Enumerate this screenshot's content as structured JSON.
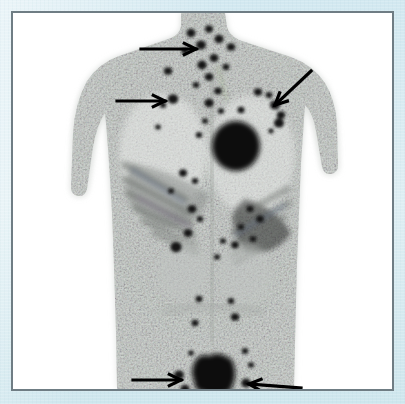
{
  "figure": {
    "caption": "",
    "modality_label": "whole-body maximum intensity projection scan",
    "frame_border_color": "#6f7d84",
    "page_background_color": "#dcebf0",
    "scan_background_color": "#ffffff",
    "lesion_color": "#111111",
    "soft_tissue_color": "#c9cdc9",
    "annotation_arrow_color": "#000000",
    "annotation_arrow_count": 5
  },
  "scan": {
    "view": "anterior whole-body MIP",
    "body": {
      "head_neck_top_y": 0,
      "shoulder_span_px": 262,
      "torso_bottom_y": 380
    },
    "arrows": [
      {
        "id": "arrow-1",
        "label": "supraclavicular nodal focus",
        "direction": "right",
        "tail_x": 128,
        "tail_y": 36,
        "head_x": 183,
        "head_y": 36
      },
      {
        "id": "arrow-2",
        "label": "left axillary nodal focus",
        "direction": "right",
        "tail_x": 104,
        "tail_y": 88,
        "head_x": 152,
        "head_y": 88
      },
      {
        "id": "arrow-3",
        "label": "right axillary nodal focus",
        "direction": "down-left",
        "tail_x": 298,
        "tail_y": 58,
        "head_x": 262,
        "head_y": 92
      },
      {
        "id": "arrow-4",
        "label": "left inguinal nodal focus",
        "direction": "right",
        "tail_x": 120,
        "tail_y": 367,
        "head_x": 168,
        "head_y": 367
      },
      {
        "id": "arrow-5",
        "label": "right inguinal nodal focus",
        "direction": "left",
        "tail_x": 288,
        "tail_y": 375,
        "head_x": 236,
        "head_y": 371
      }
    ],
    "major_foci": [
      {
        "id": "focus-mediastinal-mass",
        "label": "large mediastinal mass",
        "cx": 223,
        "cy": 133,
        "rx": 24,
        "ry": 25
      },
      {
        "id": "focus-bladder",
        "label": "urinary bladder uptake",
        "cx": 201,
        "cy": 362,
        "rx": 22,
        "ry": 19
      }
    ],
    "lesions": [
      {
        "cx": 178,
        "cy": 20,
        "r": 4.5
      },
      {
        "cx": 196,
        "cy": 16,
        "r": 4.0
      },
      {
        "cx": 188,
        "cy": 32,
        "r": 5.0
      },
      {
        "cx": 206,
        "cy": 26,
        "r": 4.6
      },
      {
        "cx": 218,
        "cy": 34,
        "r": 4.2
      },
      {
        "cx": 172,
        "cy": 38,
        "r": 3.6
      },
      {
        "cx": 201,
        "cy": 45,
        "r": 4.4
      },
      {
        "cx": 189,
        "cy": 52,
        "r": 4.8
      },
      {
        "cx": 155,
        "cy": 58,
        "r": 4.2
      },
      {
        "cx": 213,
        "cy": 54,
        "r": 3.4
      },
      {
        "cx": 196,
        "cy": 64,
        "r": 4.3
      },
      {
        "cx": 183,
        "cy": 72,
        "r": 3.3
      },
      {
        "cx": 205,
        "cy": 78,
        "r": 3.9
      },
      {
        "cx": 160,
        "cy": 86,
        "r": 5.2
      },
      {
        "cx": 150,
        "cy": 92,
        "r": 3.2
      },
      {
        "cx": 196,
        "cy": 90,
        "r": 4.7
      },
      {
        "cx": 208,
        "cy": 98,
        "r": 3.1
      },
      {
        "cx": 245,
        "cy": 79,
        "r": 4.1
      },
      {
        "cx": 256,
        "cy": 82,
        "r": 3.3
      },
      {
        "cx": 262,
        "cy": 92,
        "r": 5.0
      },
      {
        "cx": 268,
        "cy": 102,
        "r": 4.2
      },
      {
        "cx": 266,
        "cy": 110,
        "r": 5.1
      },
      {
        "cx": 228,
        "cy": 97,
        "r": 3.5
      },
      {
        "cx": 192,
        "cy": 108,
        "r": 3.0
      },
      {
        "cx": 145,
        "cy": 114,
        "r": 2.8
      },
      {
        "cx": 258,
        "cy": 118,
        "r": 2.6
      },
      {
        "cx": 186,
        "cy": 122,
        "r": 3.2
      },
      {
        "cx": 170,
        "cy": 160,
        "r": 4.0
      },
      {
        "cx": 182,
        "cy": 168,
        "r": 3.2
      },
      {
        "cx": 158,
        "cy": 178,
        "r": 3.0
      },
      {
        "cx": 179,
        "cy": 196,
        "r": 4.4
      },
      {
        "cx": 187,
        "cy": 206,
        "r": 3.2
      },
      {
        "cx": 237,
        "cy": 196,
        "r": 3.6
      },
      {
        "cx": 247,
        "cy": 206,
        "r": 4.0
      },
      {
        "cx": 228,
        "cy": 214,
        "r": 3.2
      },
      {
        "cx": 175,
        "cy": 220,
        "r": 4.4
      },
      {
        "cx": 163,
        "cy": 234,
        "r": 5.6
      },
      {
        "cx": 210,
        "cy": 228,
        "r": 3.0
      },
      {
        "cx": 222,
        "cy": 232,
        "r": 3.8
      },
      {
        "cx": 240,
        "cy": 226,
        "r": 3.3
      },
      {
        "cx": 204,
        "cy": 244,
        "r": 3.0
      },
      {
        "cx": 186,
        "cy": 286,
        "r": 3.4
      },
      {
        "cx": 218,
        "cy": 288,
        "r": 3.2
      },
      {
        "cx": 182,
        "cy": 310,
        "r": 3.5
      },
      {
        "cx": 222,
        "cy": 304,
        "r": 4.2
      },
      {
        "cx": 178,
        "cy": 340,
        "r": 2.8
      },
      {
        "cx": 232,
        "cy": 338,
        "r": 3.2
      },
      {
        "cx": 166,
        "cy": 362,
        "r": 5.0
      },
      {
        "cx": 172,
        "cy": 376,
        "r": 4.6
      },
      {
        "cx": 233,
        "cy": 370,
        "r": 4.8
      },
      {
        "cx": 238,
        "cy": 352,
        "r": 3.0
      }
    ]
  }
}
